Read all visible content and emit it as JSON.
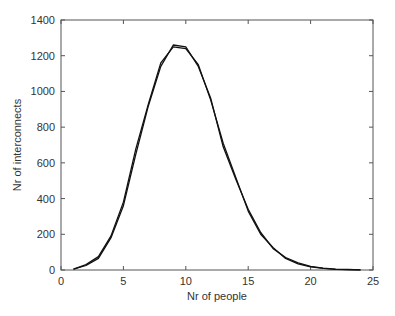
{
  "chart_data": {
    "type": "line",
    "title": "",
    "xlabel": "Nr of people",
    "ylabel": "Nr of interconnects",
    "xlim": [
      0,
      25
    ],
    "ylim": [
      0,
      1400
    ],
    "xticks": [
      0,
      5,
      10,
      15,
      20,
      25
    ],
    "yticks": [
      0,
      200,
      400,
      600,
      800,
      1000,
      1200,
      1400
    ],
    "grid": false,
    "legend": null,
    "x": [
      1,
      2,
      3,
      4,
      5,
      6,
      7,
      8,
      9,
      10,
      11,
      12,
      13,
      14,
      15,
      16,
      17,
      18,
      19,
      20,
      21,
      22,
      23,
      24
    ],
    "series": [
      {
        "name": "series-1",
        "values": [
          5,
          25,
          65,
          180,
          360,
          650,
          920,
          1140,
          1260,
          1250,
          1140,
          960,
          690,
          510,
          340,
          210,
          120,
          70,
          40,
          20,
          10,
          5,
          3,
          1
        ]
      },
      {
        "name": "series-2",
        "values": [
          5,
          30,
          75,
          190,
          380,
          680,
          930,
          1160,
          1250,
          1240,
          1150,
          950,
          710,
          520,
          330,
          200,
          125,
          65,
          35,
          18,
          9,
          4,
          2,
          1
        ]
      }
    ]
  }
}
